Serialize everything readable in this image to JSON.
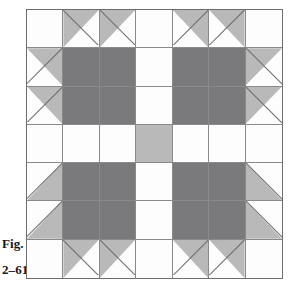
{
  "figure": {
    "label_line1": "Fig.",
    "label_line2": "2–61"
  },
  "colors": {
    "background": "#ffffff",
    "white_patch": "#fdfdfd",
    "light_gray_patch": "#b9b9b9",
    "dark_gray_patch": "#7a7a7c",
    "grid_line": "#8a8a8d",
    "border": "#6d6d70",
    "caption_text": "#18181a"
  },
  "quilt": {
    "grid_columns": 7,
    "grid_rows": 7,
    "cells": [
      [
        {
          "name": "cell-r1c1",
          "fill": "white"
        },
        {
          "name": "cell-r1c2",
          "fill": "triangle",
          "triangle": "tl"
        },
        {
          "name": "cell-r1c3",
          "fill": "triangle",
          "triangle": "tl"
        },
        {
          "name": "cell-r1c4",
          "fill": "white"
        },
        {
          "name": "cell-r1c5",
          "fill": "triangle",
          "triangle": "tr"
        },
        {
          "name": "cell-r1c6",
          "fill": "triangle",
          "triangle": "tr"
        },
        {
          "name": "cell-r1c7",
          "fill": "white"
        }
      ],
      [
        {
          "name": "cell-r2c1",
          "fill": "triangle",
          "triangle": "tr"
        },
        {
          "name": "cell-r2c2",
          "fill": "dark"
        },
        {
          "name": "cell-r2c3",
          "fill": "dark"
        },
        {
          "name": "cell-r2c4",
          "fill": "white"
        },
        {
          "name": "cell-r2c5",
          "fill": "dark"
        },
        {
          "name": "cell-r2c6",
          "fill": "dark"
        },
        {
          "name": "cell-r2c7",
          "fill": "triangle",
          "triangle": "tl"
        }
      ],
      [
        {
          "name": "cell-r3c1",
          "fill": "triangle",
          "triangle": "tr"
        },
        {
          "name": "cell-r3c2",
          "fill": "dark"
        },
        {
          "name": "cell-r3c3",
          "fill": "dark"
        },
        {
          "name": "cell-r3c4",
          "fill": "white"
        },
        {
          "name": "cell-r3c5",
          "fill": "dark"
        },
        {
          "name": "cell-r3c6",
          "fill": "dark"
        },
        {
          "name": "cell-r3c7",
          "fill": "triangle",
          "triangle": "tl"
        }
      ],
      [
        {
          "name": "cell-r4c1",
          "fill": "white"
        },
        {
          "name": "cell-r4c2",
          "fill": "white"
        },
        {
          "name": "cell-r4c3",
          "fill": "white"
        },
        {
          "name": "cell-r4c4",
          "fill": "light"
        },
        {
          "name": "cell-r4c5",
          "fill": "white"
        },
        {
          "name": "cell-r4c6",
          "fill": "white"
        },
        {
          "name": "cell-r4c7",
          "fill": "white"
        }
      ],
      [
        {
          "name": "cell-r5c1",
          "fill": "triangle",
          "triangle": "br"
        },
        {
          "name": "cell-r5c2",
          "fill": "dark"
        },
        {
          "name": "cell-r5c3",
          "fill": "dark"
        },
        {
          "name": "cell-r5c4",
          "fill": "white"
        },
        {
          "name": "cell-r5c5",
          "fill": "dark"
        },
        {
          "name": "cell-r5c6",
          "fill": "dark"
        },
        {
          "name": "cell-r5c7",
          "fill": "triangle",
          "triangle": "bl"
        }
      ],
      [
        {
          "name": "cell-r6c1",
          "fill": "triangle",
          "triangle": "br"
        },
        {
          "name": "cell-r6c2",
          "fill": "dark"
        },
        {
          "name": "cell-r6c3",
          "fill": "dark"
        },
        {
          "name": "cell-r6c4",
          "fill": "white"
        },
        {
          "name": "cell-r6c5",
          "fill": "dark"
        },
        {
          "name": "cell-r6c6",
          "fill": "dark"
        },
        {
          "name": "cell-r6c7",
          "fill": "triangle",
          "triangle": "bl"
        }
      ],
      [
        {
          "name": "cell-r7c1",
          "fill": "white"
        },
        {
          "name": "cell-r7c2",
          "fill": "triangle",
          "triangle": "tl"
        },
        {
          "name": "cell-r7c3",
          "fill": "triangle",
          "triangle": "tl"
        },
        {
          "name": "cell-r7c4",
          "fill": "white"
        },
        {
          "name": "cell-r7c5",
          "fill": "triangle",
          "triangle": "tr"
        },
        {
          "name": "cell-r7c6",
          "fill": "triangle",
          "triangle": "tr"
        },
        {
          "name": "cell-r7c7",
          "fill": "white"
        }
      ]
    ]
  }
}
